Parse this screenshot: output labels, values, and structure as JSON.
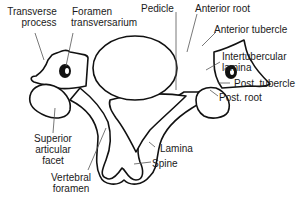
{
  "diagram": {
    "colors": {
      "outline": "#111111",
      "leader": "#555555",
      "fill": "#ffffff",
      "text": "#1a1a1a"
    },
    "labels": {
      "transverse_process": [
        "Transverse",
        "process"
      ],
      "foramen_transversarium": [
        "Foramen",
        "transversarium"
      ],
      "pedicle": "Pedicle",
      "anterior_root": "Anterior root",
      "anterior_tubercle": "Anterior tubercle",
      "intertubercular_lamina": [
        "Intertubercular",
        "lamina"
      ],
      "post_tubercle": "Post. tubercle",
      "post_root": "Post. root",
      "superior_articular_facet": [
        "Superior",
        "articular",
        "facet"
      ],
      "lamina": "Lamina",
      "spine": "Spine",
      "vertebral_foramen": [
        "Vertebral",
        "foramen"
      ]
    }
  }
}
